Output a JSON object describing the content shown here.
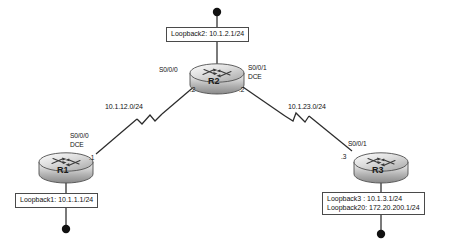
{
  "diagram": {
    "type": "network-topology",
    "background_color": "#ffffff",
    "routers": [
      {
        "id": "r1",
        "name": "R1",
        "interfaces": [
          {
            "name": "S0/0/0",
            "role": "DCE",
            "address_suffix": ".1"
          }
        ],
        "loopback_label_lines": [
          "Loopback1: 10.1.1.1/24"
        ]
      },
      {
        "id": "r2",
        "name": "R2",
        "interfaces": [
          {
            "name": "S0/0/0",
            "role": "",
            "address_suffix": ".2"
          },
          {
            "name": "S0/0/1",
            "role": "DCE",
            "address_suffix": ".2"
          }
        ],
        "loopback_label_lines": [
          "Loopback2: 10.1.2.1/24"
        ]
      },
      {
        "id": "r3",
        "name": "R3",
        "interfaces": [
          {
            "name": "S0/0/1",
            "role": "",
            "address_suffix": ".3"
          }
        ],
        "loopback_label_lines": [
          "Loopback3 : 10.1.3.1/24",
          "Loopback20: 172.20.200.1/24"
        ]
      }
    ],
    "links": [
      {
        "id": "link-r1-r2",
        "subnet": "10.1.12.0/24",
        "endpoints": [
          "R1",
          "R2"
        ],
        "media": "serial"
      },
      {
        "id": "link-r2-r3",
        "subnet": "10.1.23.0/24",
        "endpoints": [
          "R2",
          "R3"
        ],
        "media": "serial"
      }
    ],
    "labels": {
      "r1_iface_name": "S0/0/0",
      "r1_iface_role": "DCE",
      "r1_ip_suffix": ".1",
      "r2_left_iface_name": "S0/0/0",
      "r2_left_ip_suffix": ".2",
      "r2_right_iface_name": "S0/0/1",
      "r2_right_iface_role": "DCE",
      "r2_right_ip_suffix": ".2",
      "r3_iface_name": "S0/0/1",
      "r3_ip_suffix": ".3",
      "subnet_left": "10.1.12.0/24",
      "subnet_right": "10.1.23.0/24",
      "loopback1": "Loopback1: 10.1.1.1/24",
      "loopback2": "Loopback2: 10.1.2.1/24",
      "loopback3": "Loopback3 : 10.1.3.1/24",
      "loopback20": "Loopback20: 172.20.200.1/24"
    },
    "colors": {
      "line": "#2b2b2b",
      "router_body_light": "#e8e8e8",
      "router_body_mid": "#bdbdbd",
      "router_body_dark": "#8d8d8d",
      "router_top_light": "#f2f2f2",
      "label_border": "#4a4a4a",
      "endpoint_dot": "#111111",
      "text": "#111111"
    }
  }
}
